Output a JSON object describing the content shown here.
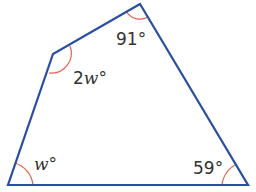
{
  "diagram": {
    "type": "quadrilateral",
    "colors": {
      "edge": "#2b4fa0",
      "arc": "#e8604c",
      "text": "#333333"
    },
    "vertices": {
      "top": [
        140,
        4
      ],
      "left": [
        53,
        54
      ],
      "bottom_left": [
        8,
        185
      ],
      "bottom_right": [
        248,
        185
      ]
    },
    "angles": {
      "top": {
        "value": "91",
        "unit": "°"
      },
      "left": {
        "coef": "2",
        "var": "w",
        "unit": "°"
      },
      "bottom_left": {
        "var": "w",
        "unit": "°"
      },
      "bottom_right": {
        "value": "59",
        "unit": "°"
      }
    }
  }
}
